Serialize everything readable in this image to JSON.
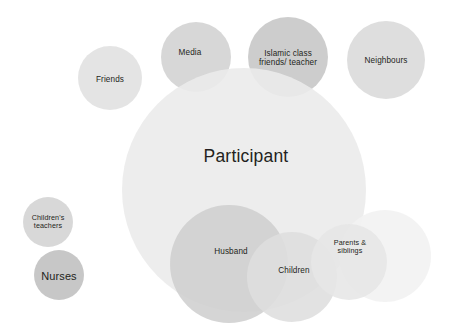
{
  "diagram": {
    "background_color": "#ffffff",
    "width": 452,
    "height": 328,
    "nodes": [
      {
        "id": "friends",
        "label": "Friends",
        "label_lines": "Friends",
        "cx": 110,
        "cy": 78,
        "r": 32,
        "fill": "#e3e3e3",
        "opacity": 0.95,
        "label_size": "md",
        "label_cx": 110,
        "label_cy": 80
      },
      {
        "id": "media",
        "label": "Media",
        "label_lines": "Media",
        "cx": 196,
        "cy": 57,
        "r": 35,
        "fill": "#d4d4d4",
        "opacity": 0.92,
        "label_size": "md",
        "label_cx": 190,
        "label_cy": 53
      },
      {
        "id": "islamic-class-friends-teacher",
        "label": "Islamic class friends/ teacher",
        "label_lines": "Islamic class\nfriends/ teacher",
        "cx": 288,
        "cy": 57,
        "r": 40,
        "fill": "#c9c9c9",
        "opacity": 0.92,
        "label_size": "md",
        "label_cx": 288,
        "label_cy": 58
      },
      {
        "id": "neighbours",
        "label": "Neighbours",
        "label_lines": "Neighbours",
        "cx": 386,
        "cy": 60,
        "r": 39,
        "fill": "#dcdcdc",
        "opacity": 0.95,
        "label_size": "md",
        "label_cx": 386,
        "label_cy": 61
      },
      {
        "id": "participant",
        "label": "Participant",
        "label_lines": "Participant",
        "cx": 244,
        "cy": 190,
        "r": 122,
        "fill": "#ebebeb",
        "opacity": 0.9,
        "label_size": "participant",
        "label_cx": 246,
        "label_cy": 157
      },
      {
        "id": "childrens-teachers",
        "label": "Children's teachers",
        "label_lines": "Children's\nteachers",
        "cx": 48,
        "cy": 222,
        "r": 25,
        "fill": "#d6d6d6",
        "opacity": 0.95,
        "label_size": "sm",
        "label_cx": 48,
        "label_cy": 222
      },
      {
        "id": "nurses",
        "label": "Nurses",
        "label_lines": "Nurses",
        "cx": 59,
        "cy": 275,
        "r": 25,
        "fill": "#c4c4c4",
        "opacity": 0.95,
        "label_size": "nurses",
        "label_cx": 59,
        "label_cy": 276
      },
      {
        "id": "husband",
        "label": "Husband",
        "label_lines": "Husband",
        "cx": 229,
        "cy": 264,
        "r": 59,
        "fill": "#cfcfcf",
        "opacity": 0.88,
        "label_size": "md",
        "label_cx": 231,
        "label_cy": 252
      },
      {
        "id": "parents-siblings-outer",
        "label": "",
        "label_lines": "",
        "cx": 385,
        "cy": 256,
        "r": 46,
        "fill": "#f2f2f2",
        "opacity": 0.9,
        "label_size": "sm",
        "label_cx": 385,
        "label_cy": 256
      },
      {
        "id": "children",
        "label": "Children",
        "label_lines": "Children",
        "cx": 292,
        "cy": 277,
        "r": 45,
        "fill": "#dedede",
        "opacity": 0.88,
        "label_size": "md",
        "label_cx": 294,
        "label_cy": 271
      },
      {
        "id": "parents-siblings",
        "label": "Parents & siblings",
        "label_lines": "Parents &\nsiblings",
        "cx": 349,
        "cy": 262,
        "r": 38,
        "fill": "#e6e6e6",
        "opacity": 0.88,
        "label_size": "sm",
        "label_cx": 350,
        "label_cy": 247
      }
    ]
  }
}
